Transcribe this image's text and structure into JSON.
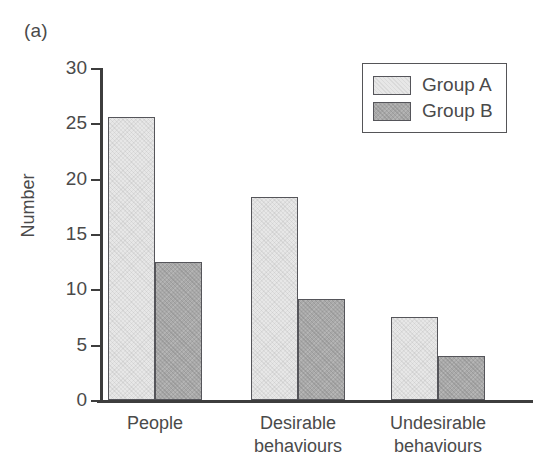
{
  "panel": {
    "label": "(a)"
  },
  "chart_data": {
    "type": "bar",
    "title": "",
    "xlabel": "",
    "ylabel": "Number",
    "ylim": [
      0,
      30
    ],
    "yticks": [
      0,
      5,
      10,
      15,
      20,
      25,
      30
    ],
    "ytick_labels": [
      "0",
      "5",
      "10",
      "15",
      "20",
      "25",
      "30"
    ],
    "grid": false,
    "legend_position": "top-right",
    "categories": [
      "People",
      "Desirable behaviours",
      "Undesirable behaviours"
    ],
    "category_lines": [
      [
        "People"
      ],
      [
        "Desirable",
        "behaviours"
      ],
      [
        "Undesirable",
        "behaviours"
      ]
    ],
    "series": [
      {
        "name": "Group A",
        "color": "#e7e7e7",
        "edge_color": "#55555a",
        "values": [
          25.6,
          18.3,
          7.5
        ]
      },
      {
        "name": "Group B",
        "color": "#a9a9a9",
        "edge_color": "#55555a",
        "values": [
          12.5,
          9.1,
          4.0
        ]
      }
    ]
  }
}
